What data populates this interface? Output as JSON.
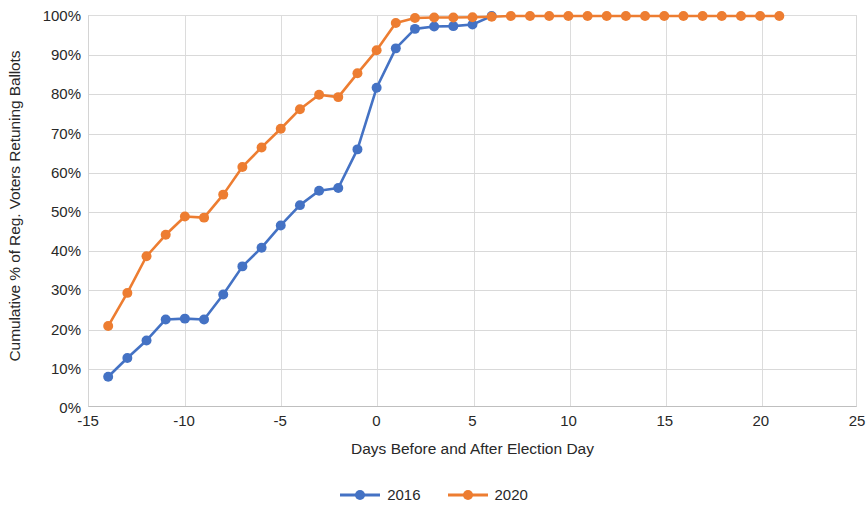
{
  "chart_data": {
    "type": "line",
    "title": "",
    "xlabel": "Days Before and After Election Day",
    "ylabel": "Cumulative % of Reg. Voters Retuning Ballots",
    "xlim": [
      -15,
      25
    ],
    "ylim": [
      0,
      100
    ],
    "xticks": [
      -15,
      -10,
      -5,
      0,
      5,
      10,
      15,
      20,
      25
    ],
    "xtick_labels": [
      "-15",
      "-10",
      "-5",
      "0",
      "5",
      "10",
      "15",
      "20",
      "25"
    ],
    "yticks": [
      0,
      10,
      20,
      30,
      40,
      50,
      60,
      70,
      80,
      90,
      100
    ],
    "ytick_labels": [
      "0%",
      "10%",
      "20%",
      "30%",
      "40%",
      "50%",
      "60%",
      "70%",
      "80%",
      "90%",
      "100%"
    ],
    "grid": "both",
    "legend_position": "bottom",
    "markers": "circle",
    "series": [
      {
        "name": "2016",
        "color": "#4472C4",
        "x": [
          -14,
          -13,
          -12,
          -11,
          -10,
          -9,
          -8,
          -7,
          -6,
          -5,
          -4,
          -3,
          -2,
          -1,
          0,
          1,
          2,
          3,
          4,
          5,
          6
        ],
        "values": [
          7.5,
          12.3,
          16.8,
          22.2,
          22.4,
          22.2,
          28.6,
          35.8,
          40.6,
          46.3,
          51.5,
          55.2,
          55.9,
          65.8,
          81.6,
          91.7,
          96.7,
          97.3,
          97.4,
          97.8,
          100.0
        ]
      },
      {
        "name": "2020",
        "color": "#ED7D31",
        "x": [
          -14,
          -13,
          -12,
          -11,
          -10,
          -9,
          -8,
          -7,
          -6,
          -5,
          -4,
          -3,
          -2,
          -1,
          0,
          1,
          2,
          3,
          4,
          5,
          6,
          7,
          8,
          9,
          10,
          11,
          12,
          13,
          14,
          15,
          16,
          17,
          18,
          19,
          20,
          21
        ],
        "values": [
          20.5,
          29.0,
          38.4,
          43.9,
          48.6,
          48.3,
          54.2,
          61.3,
          66.3,
          71.1,
          76.1,
          79.8,
          79.2,
          85.3,
          91.2,
          98.2,
          99.5,
          99.6,
          99.6,
          99.7,
          99.8,
          100.0,
          100.0,
          100.0,
          100.0,
          100.0,
          100.0,
          100.0,
          100.0,
          100.0,
          100.0,
          100.0,
          100.0,
          100.0,
          100.0,
          100.0
        ]
      }
    ]
  },
  "legend": {
    "entries": [
      {
        "label": "2016",
        "color": "#4472C4"
      },
      {
        "label": "2020",
        "color": "#ED7D31"
      }
    ]
  }
}
